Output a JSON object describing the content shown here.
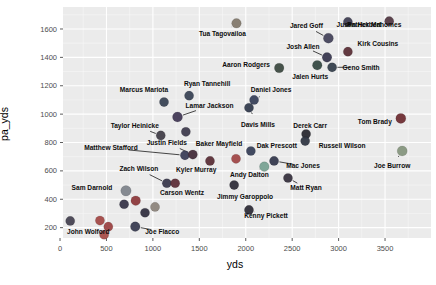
{
  "figure": {
    "background": "#ffffff",
    "panel_bg": "#ebebeb",
    "grid_major_color": "#ffffff",
    "grid_minor_color": "#f7f7f7",
    "tick_mark_color": "#333333",
    "tick_label_color": "#4d4d4d",
    "point_label_color": "#0d0d0d",
    "axis_title_color": "#000000"
  },
  "chart_data": {
    "type": "scatter",
    "title": "",
    "xlabel": "yds",
    "ylabel": "pa_yds",
    "x_ticks": [
      0,
      500,
      1000,
      1500,
      2000,
      2500,
      3000,
      3500
    ],
    "y_ticks": [
      200,
      400,
      600,
      800,
      1000,
      1200,
      1400,
      1600
    ],
    "x_minor_ticks": [
      250,
      750,
      1250,
      1750,
      2250,
      2750,
      3250,
      3750
    ],
    "y_minor_ticks": [
      300,
      500,
      700,
      900,
      1100,
      1300,
      1500,
      1700
    ],
    "xlim": [
      32,
      3995
    ],
    "ylim": [
      127,
      1755
    ],
    "grid": true,
    "legend": "none",
    "points": [
      {
        "name": "Tua Tagovailoa",
        "x": 1900,
        "y": 1640,
        "color": "#83796d",
        "r": 4.8,
        "dx": -14,
        "dy": 10,
        "leader": true
      },
      {
        "name": "Jared Goff",
        "x": 2890,
        "y": 1535,
        "color": "#46455c",
        "r": 5.0,
        "dx": -22,
        "dy": -12,
        "leader": true
      },
      {
        "name": "Justin Herbert",
        "x": 3100,
        "y": 1650,
        "color": "#3f3e52",
        "r": 4.6,
        "dx": 11,
        "dy": 3,
        "leader": false
      },
      {
        "name": "Patrick Mahomes",
        "x": 3545,
        "y": 1655,
        "color": "#533a44",
        "r": 4.6,
        "dx": -15,
        "dy": 4,
        "leader": false
      },
      {
        "name": "Kirk Cousins",
        "x": 3100,
        "y": 1440,
        "color": "#5c3038",
        "r": 4.6,
        "dx": 30,
        "dy": -8,
        "leader": false
      },
      {
        "name": "Josh Allen",
        "x": 2875,
        "y": 1400,
        "color": "#3a3950",
        "r": 4.8,
        "dx": -24,
        "dy": -11,
        "leader": true
      },
      {
        "name": "Geno Smith",
        "x": 2930,
        "y": 1330,
        "color": "#37414e",
        "r": 4.6,
        "dx": 29,
        "dy": 0,
        "leader": true
      },
      {
        "name": "Jalen Hurts",
        "x": 2770,
        "y": 1345,
        "color": "#374a44",
        "r": 4.8,
        "dx": -7,
        "dy": 12,
        "leader": false
      },
      {
        "name": "Aaron Rodgers",
        "x": 2360,
        "y": 1325,
        "color": "#3d4a41",
        "r": 4.8,
        "dx": -33,
        "dy": -3,
        "leader": false
      },
      {
        "name": "Ryan Tannehill",
        "x": 1390,
        "y": 1130,
        "color": "#3b4456",
        "r": 4.6,
        "dx": 18,
        "dy": -12,
        "leader": false
      },
      {
        "name": "Marcus Mariota",
        "x": 1120,
        "y": 1085,
        "color": "#3a4455",
        "r": 4.6,
        "dx": -20,
        "dy": -12,
        "leader": false
      },
      {
        "name": "Lamar Jackson",
        "x": 1265,
        "y": 980,
        "color": "#433a56",
        "r": 5.0,
        "dx": 32,
        "dy": -11,
        "leader": true
      },
      {
        "name": "Daniel Jones",
        "x": 2090,
        "y": 1100,
        "color": "#39415a",
        "r": 4.6,
        "dx": 17,
        "dy": -10,
        "leader": true
      },
      {
        "name": "Davis Mills",
        "x": 2035,
        "y": 1045,
        "color": "#343c4e",
        "r": 4.6,
        "dx": 9,
        "dy": 17,
        "leader": true
      },
      {
        "name": "Taylor Heinicke",
        "x": 1085,
        "y": 850,
        "color": "#43404a",
        "r": 4.6,
        "dx": -26,
        "dy": -10,
        "leader": true
      },
      {
        "name": "",
        "x": 1355,
        "y": 875,
        "color": "#3f3c4e",
        "r": 4.6,
        "dx": 0,
        "dy": 0,
        "leader": false
      },
      {
        "name": "Derek Carr",
        "x": 2650,
        "y": 860,
        "color": "#2b2b33",
        "r": 4.6,
        "dx": 4,
        "dy": -8,
        "leader": false
      },
      {
        "name": "Russell Wilson",
        "x": 2640,
        "y": 810,
        "color": "#313844",
        "r": 4.6,
        "dx": 37,
        "dy": 5,
        "leader": false
      },
      {
        "name": "Tom Brady",
        "x": 3670,
        "y": 970,
        "color": "#702f35",
        "r": 5.0,
        "dx": -26,
        "dy": 3,
        "leader": false
      },
      {
        "name": "Matthew Stafford",
        "x": 1345,
        "y": 710,
        "color": "#3c3f58",
        "r": 4.6,
        "dx": -74,
        "dy": -7,
        "leader": true
      },
      {
        "name": "Justin Fields",
        "x": 1430,
        "y": 715,
        "color": "#472f3d",
        "r": 4.6,
        "dx": -26,
        "dy": -12,
        "leader": true
      },
      {
        "name": "Baker Mayfield",
        "x": 1615,
        "y": 670,
        "color": "#5b2f38",
        "r": 4.6,
        "dx": 9,
        "dy": -17,
        "leader": true
      },
      {
        "name": "Dak Prescott",
        "x": 2055,
        "y": 740,
        "color": "#39415a",
        "r": 4.6,
        "dx": 26,
        "dy": -5,
        "leader": false
      },
      {
        "name": "",
        "x": 1895,
        "y": 685,
        "color": "#a04848",
        "r": 4.6,
        "dx": 0,
        "dy": 0,
        "leader": false
      },
      {
        "name": "Andy Dalton",
        "x": 2200,
        "y": 630,
        "color": "#79a293",
        "r": 4.8,
        "dx": -15,
        "dy": 8,
        "leader": true
      },
      {
        "name": "Mac Jones",
        "x": 2305,
        "y": 670,
        "color": "#363a4e",
        "r": 4.6,
        "dx": 29,
        "dy": 5,
        "leader": true
      },
      {
        "name": "Joe Burrow",
        "x": 3685,
        "y": 740,
        "color": "#87977f",
        "r": 5.0,
        "dx": -10,
        "dy": 15,
        "leader": true
      },
      {
        "name": "Matt Ryan",
        "x": 2455,
        "y": 550,
        "color": "#38333f",
        "r": 4.6,
        "dx": 18,
        "dy": 10,
        "leader": true
      },
      {
        "name": "Jimmy Garoppolo",
        "x": 1875,
        "y": 500,
        "color": "#322f3b",
        "r": 4.6,
        "dx": 11,
        "dy": 12,
        "leader": true
      },
      {
        "name": "Kenny Pickett",
        "x": 2035,
        "y": 325,
        "color": "#2f2d38",
        "r": 4.6,
        "dx": 17,
        "dy": 6,
        "leader": true
      },
      {
        "name": "Zach Wilson",
        "x": 1150,
        "y": 513,
        "color": "#3b3a4d",
        "r": 4.6,
        "dx": -28,
        "dy": -14,
        "leader": true
      },
      {
        "name": "Kyler Murray",
        "x": 1240,
        "y": 513,
        "color": "#5e2f39",
        "r": 4.6,
        "dx": 21,
        "dy": -13,
        "leader": false
      },
      {
        "name": "Carson Wentz",
        "x": 1023,
        "y": 346,
        "color": "#8d857c",
        "r": 4.6,
        "dx": 27,
        "dy": -14,
        "leader": false
      },
      {
        "name": "Sam Darnold",
        "x": 710,
        "y": 460,
        "color": "#7f858c",
        "r": 5.2,
        "dx": -34,
        "dy": -3,
        "leader": false
      },
      {
        "name": "",
        "x": 815,
        "y": 390,
        "color": "#8d3a3c",
        "r": 4.8,
        "dx": 0,
        "dy": 0,
        "leader": false
      },
      {
        "name": "",
        "x": 690,
        "y": 365,
        "color": "#39374a",
        "r": 4.6,
        "dx": 0,
        "dy": 0,
        "leader": false
      },
      {
        "name": "",
        "x": 915,
        "y": 305,
        "color": "#343241",
        "r": 4.6,
        "dx": 0,
        "dy": 0,
        "leader": false
      },
      {
        "name": "Joe Flacco",
        "x": 810,
        "y": 207,
        "color": "#3a3d52",
        "r": 4.8,
        "dx": 27,
        "dy": 5,
        "leader": true
      },
      {
        "name": "John Wolford",
        "x": 110,
        "y": 247,
        "color": "#474352",
        "r": 4.6,
        "dx": 18,
        "dy": 11,
        "leader": false
      },
      {
        "name": "",
        "x": 430,
        "y": 250,
        "color": "#a34a48",
        "r": 4.6,
        "dx": 0,
        "dy": 0,
        "leader": false
      },
      {
        "name": "",
        "x": 520,
        "y": 207,
        "color": "#9c4343",
        "r": 4.6,
        "dx": 0,
        "dy": 0,
        "leader": false
      },
      {
        "name": "",
        "x": 475,
        "y": 150,
        "color": "#a84f4a",
        "r": 4.6,
        "dx": 0,
        "dy": 0,
        "leader": false
      }
    ]
  }
}
